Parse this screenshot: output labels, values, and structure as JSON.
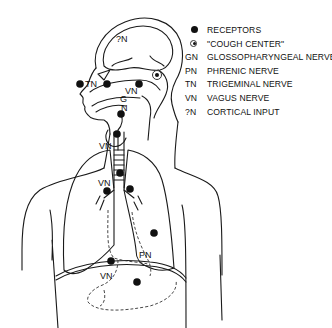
{
  "figure": {
    "labels": {
      "cortical": "?N",
      "trigeminal": "TN",
      "glosso_g": "G",
      "glosso_n": "N",
      "vagus_neck": "VN",
      "vagus_larynx": "VN",
      "vagus_bronchi": "VN",
      "phrenic": "PN",
      "vagus_abdomen": "VN"
    }
  },
  "legend": {
    "items": [
      {
        "symbol": "receptor-dot",
        "abbr": "",
        "label": "RECEPTORS"
      },
      {
        "symbol": "cough-center-ring",
        "abbr": "",
        "label": "\"COUGH CENTER\""
      },
      {
        "symbol": "",
        "abbr": "GN",
        "label": "GLOSSOPHARYNGEAL NERVE"
      },
      {
        "symbol": "",
        "abbr": "PN",
        "label": "PHRENIC NERVE"
      },
      {
        "symbol": "",
        "abbr": "TN",
        "label": "TRIGEMINAL NERVE"
      },
      {
        "symbol": "",
        "abbr": "VN",
        "label": "VAGUS NERVE"
      },
      {
        "symbol": "",
        "abbr": "?N",
        "label": "CORTICAL INPUT"
      }
    ]
  }
}
